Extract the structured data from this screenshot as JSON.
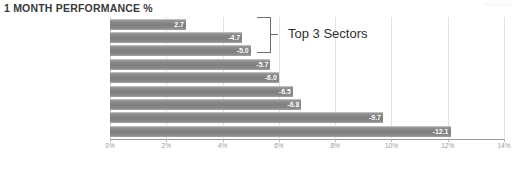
{
  "header": {
    "title": "1 MONTH PERFORMANCE %",
    "watermark": "finviz.com"
  },
  "footer": {
    "ghost_text": ""
  },
  "annotation": {
    "label": "Top 3 Sectors"
  },
  "chart_data": {
    "type": "bar",
    "orientation": "horizontal",
    "title": "1 MONTH PERFORMANCE %",
    "xlabel": "",
    "ylabel": "",
    "xlim": [
      0,
      14
    ],
    "xticks": [
      "0%",
      "2%",
      "4%",
      "6%",
      "8%",
      "10%",
      "12%",
      "14%"
    ],
    "xtick_values": [
      0,
      2,
      4,
      6,
      8,
      10,
      12,
      14
    ],
    "grid": true,
    "legend": false,
    "bar_color": "#808080",
    "value_label_color": "#ffffff",
    "note": "Bars drawn by magnitude; displayed values are negative percentages",
    "categories": [
      "Utilities",
      "Healthcare",
      "Technology",
      "Consumer Goods",
      "Services",
      "Industrial Goods",
      "Financial",
      "Conglomerates",
      "Basic Materials"
    ],
    "values": [
      -2.7,
      -4.7,
      -5.0,
      -5.7,
      -6.0,
      -6.5,
      -6.8,
      -9.7,
      -12.1
    ],
    "magnitudes": [
      2.7,
      4.7,
      5.0,
      5.7,
      6.0,
      6.5,
      6.8,
      9.7,
      12.1
    ],
    "labels": [
      "2.7",
      "-4.7",
      "-5.0",
      "-5.7",
      "-6.0",
      "-6.5",
      "-6.8",
      "-9.7",
      "-12.1"
    ],
    "annotations": [
      {
        "text": "Top 3 Sectors",
        "targets": [
          "Utilities",
          "Healthcare",
          "Technology"
        ]
      }
    ]
  }
}
